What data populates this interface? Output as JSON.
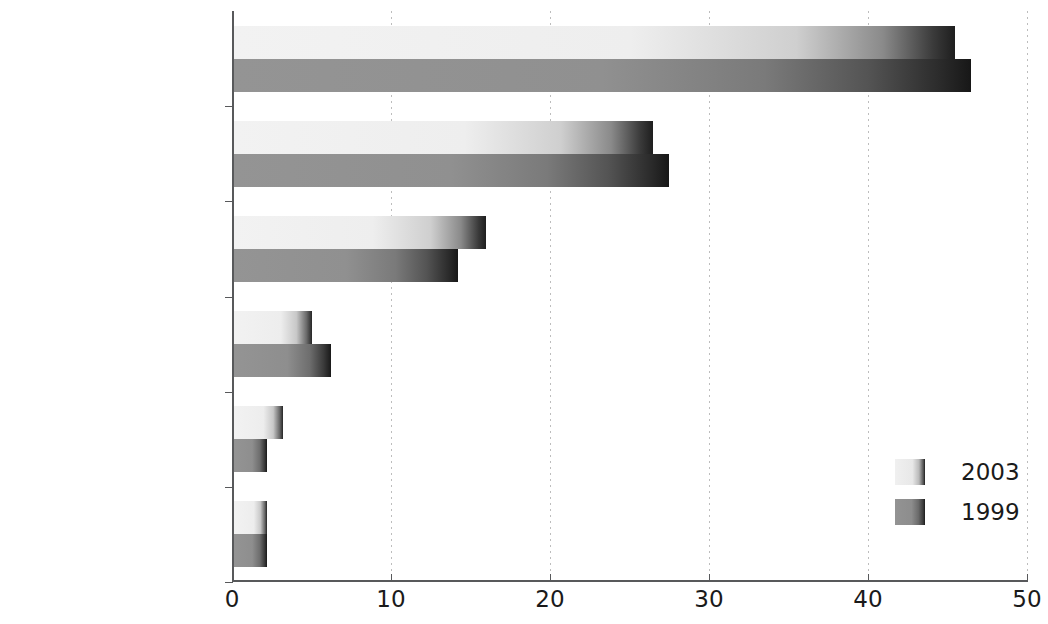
{
  "chart_data": {
    "type": "bar",
    "orientation": "horizontal",
    "title": "",
    "subtitle": "",
    "xlabel": "",
    "ylabel": "",
    "categories": [
      "Machinery and\nvehicles",
      "Other manufactured\narticles",
      "Chemicals",
      "Food and tobacco",
      "Energy",
      "Raw materials"
    ],
    "series": [
      {
        "name": "2003",
        "values": [
          45.5,
          26.5,
          16.0,
          5.0,
          3.2,
          2.2
        ],
        "color": "#ededed"
      },
      {
        "name": "1999",
        "values": [
          46.5,
          27.5,
          14.2,
          6.2,
          2.2,
          2.2
        ],
        "color": "#8c8c8c"
      }
    ],
    "xlim": [
      0,
      50
    ],
    "xticks": [
      0,
      10,
      20,
      30,
      40,
      50
    ],
    "xtick_labels": [
      "0",
      "10",
      "20",
      "30",
      "40",
      "50"
    ],
    "grid": true,
    "grid_axis": "x",
    "grid_style": "dotted",
    "legend_position": "bottom-right",
    "legend_entries": [
      "2003",
      "1999"
    ]
  },
  "axis": {
    "line_color": "#58595b",
    "grid_color": "#bdbdbd"
  }
}
